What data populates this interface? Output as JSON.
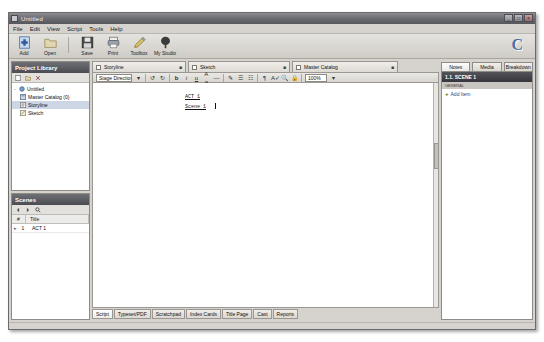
{
  "window": {
    "title": "Untitled",
    "icon": "app-icon",
    "controls": {
      "minimize": "_",
      "maximize": "□",
      "close": "×"
    }
  },
  "menubar": {
    "items": [
      {
        "label": "File"
      },
      {
        "label": "Edit"
      },
      {
        "label": "View"
      },
      {
        "label": "Script"
      },
      {
        "label": "Tools"
      },
      {
        "label": "Help"
      }
    ]
  },
  "toolbar": {
    "buttons": [
      {
        "label": "Add",
        "icon": "add-icon"
      },
      {
        "label": "Open",
        "icon": "open-folder-icon"
      },
      {
        "label": "Save",
        "icon": "save-disk-icon"
      },
      {
        "label": "Print",
        "icon": "print-icon"
      },
      {
        "label": "Toolbox",
        "icon": "pencil-toolbox-icon"
      },
      {
        "label": "My Studio",
        "icon": "tree-studio-icon"
      }
    ],
    "brand": "C"
  },
  "project_library": {
    "title": "Project Library",
    "toolbar_icons": [
      "new-icon",
      "folder-icon",
      "delete-icon"
    ],
    "tree": [
      {
        "label": "Untitled",
        "level": 0,
        "icon": "project-icon",
        "selected": false,
        "twisty": "-"
      },
      {
        "label": "Master Catalog (0)",
        "level": 1,
        "icon": "catalog-icon",
        "selected": false,
        "twisty": ""
      },
      {
        "label": "Storyline",
        "level": 1,
        "icon": "storyline-icon",
        "selected": true,
        "twisty": ""
      },
      {
        "label": "Sketch",
        "level": 1,
        "icon": "sketch-icon",
        "selected": false,
        "twisty": ""
      }
    ]
  },
  "scenes": {
    "title": "Scenes",
    "toolbar_icons": [
      "prev-icon",
      "next-icon",
      "search-icon"
    ],
    "columns": [
      "#",
      "Title"
    ],
    "rows": [
      {
        "marker": "▸",
        "num": "1",
        "title": "ACT 1"
      }
    ]
  },
  "editor": {
    "tabs": [
      {
        "label": "Storyline",
        "icon": "storyline-icon",
        "close": "■",
        "active": true
      },
      {
        "label": "Sketch",
        "icon": "sketch-icon",
        "close": "■",
        "active": false
      },
      {
        "label": "Master Catalog",
        "icon": "catalog-icon",
        "close": "■",
        "active": false
      }
    ],
    "format_toolbar": {
      "style_value": "Stage Direction",
      "zoom_value": "100%",
      "buttons": [
        "undo-icon",
        "redo-icon",
        "bold-icon",
        "italic-icon",
        "underline-icon",
        "font-size-icon",
        "strikethrough-icon",
        "highlight-icon",
        "align-left-icon",
        "align-center-icon",
        "paragraph-icon",
        "spell-check-icon",
        "find-icon",
        "lock-icon"
      ]
    },
    "script": {
      "lines": [
        {
          "text": "ACT 1"
        },
        {
          "text": "Scene 1"
        }
      ]
    },
    "bottom_tabs": [
      {
        "label": "Script",
        "active": true
      },
      {
        "label": "Typeset/PDF",
        "active": false
      },
      {
        "label": "Scratchpad",
        "active": false
      },
      {
        "label": "Index Cards",
        "active": false
      },
      {
        "label": "Title Page",
        "active": false
      },
      {
        "label": "Cast",
        "active": false
      },
      {
        "label": "Reports",
        "active": false
      }
    ]
  },
  "inspector": {
    "tabs": [
      {
        "label": "Notes",
        "active": true
      },
      {
        "label": "Media",
        "active": false
      },
      {
        "label": "Breakdown",
        "active": false
      }
    ],
    "scene_title": "1.1. SCENE 1",
    "section_label": "GENERAL",
    "add_item": "Add Item",
    "add_icon": "plus-icon"
  }
}
